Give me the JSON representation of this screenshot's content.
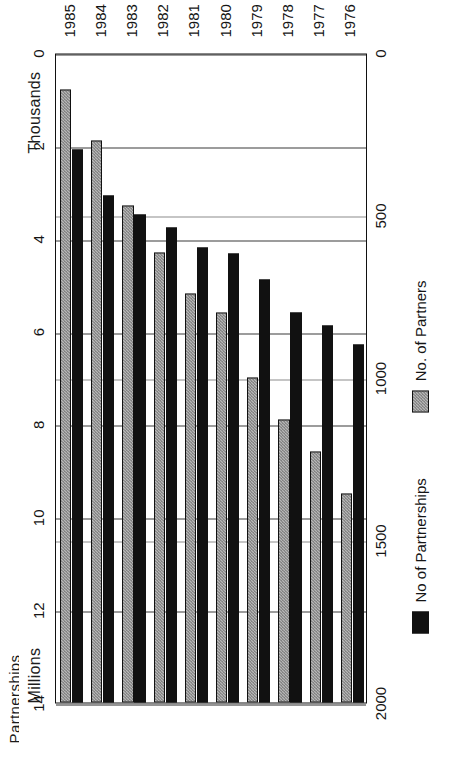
{
  "page": {
    "title_partial": "Partnerships"
  },
  "axes": {
    "top_unit_label": "Millions",
    "bottom_unit_label": "Thousands",
    "top_ticks": [
      "14",
      "12",
      "10",
      "8",
      "6",
      "4",
      "2",
      "0"
    ],
    "bottom_ticks": [
      "2000",
      "1500",
      "1000",
      "500",
      "0"
    ]
  },
  "legend": {
    "items": [
      {
        "label": "No of Partnerships",
        "swatch": "black",
        "color": "#111111"
      },
      {
        "label": "No. of Partners",
        "swatch": "gray",
        "color": "#b7b7b7"
      }
    ]
  },
  "chart_data": {
    "type": "bar",
    "title": "Partnerships",
    "orientation": "horizontal",
    "categories": [
      "1976",
      "1977",
      "1978",
      "1979",
      "1980",
      "1981",
      "1982",
      "1983",
      "1984",
      "1985"
    ],
    "series": [
      {
        "name": "No of Partnerships",
        "unit": "Thousands",
        "axis": "bottom",
        "color": "#111111",
        "values": [
          1100,
          1160,
          1200,
          1300,
          1380,
          1400,
          1460,
          1500,
          1560,
          1700
        ]
      },
      {
        "name": "No. of Partners",
        "unit": "Millions",
        "axis": "top",
        "color": "#b7b7b7",
        "values": [
          4.5,
          5.4,
          6.1,
          7.0,
          8.4,
          8.8,
          9.7,
          10.7,
          12.1,
          13.2
        ]
      }
    ],
    "xlabel": "",
    "ylabel": "",
    "top_axis_range": [
      0,
      14
    ],
    "bottom_axis_range": [
      0,
      2000
    ],
    "grid": true,
    "legend_position": "bottom"
  }
}
